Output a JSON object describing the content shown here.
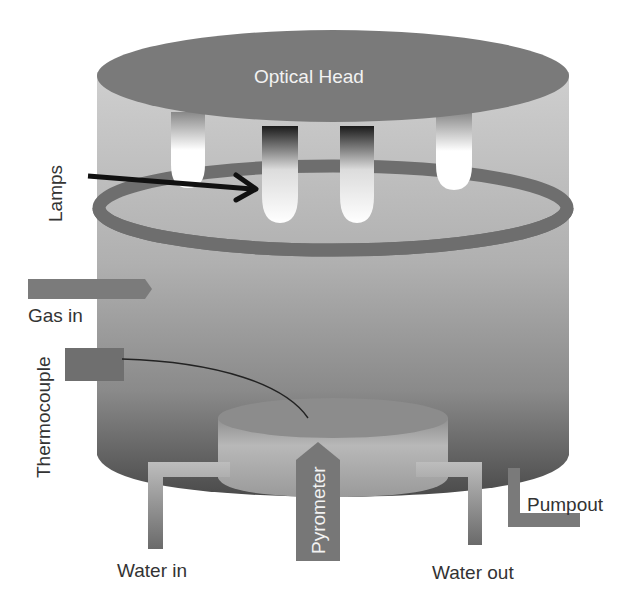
{
  "diagram": {
    "labels": {
      "optical_head": "Optical Head",
      "lamps": "Lamps",
      "gas_in": "Gas in",
      "thermocouple": "Thermocouple",
      "pyrometer": "Pyrometer",
      "water_in": "Water in",
      "water_out": "Water out",
      "pumpout": "Pumpout"
    },
    "colors": {
      "head": "#7a7a7a",
      "ring": "#6e6e6e",
      "chamber_top": "#c8c8c8",
      "chamber_bottom": "#4a4a4a",
      "pipe": "#7c7c7c",
      "arrow": "#111111",
      "text": "#333333"
    }
  }
}
